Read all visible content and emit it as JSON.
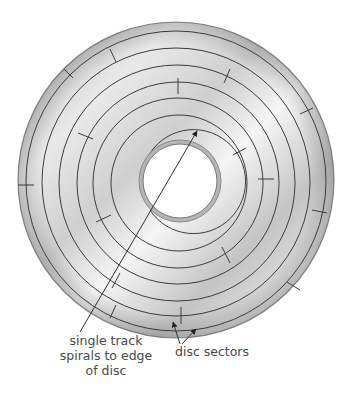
{
  "figure": {
    "colors": {
      "disc_light": "#f2f2f2",
      "disc_mid": "#c8c8c8",
      "disc_dark": "#9a9a9a",
      "track_line": "#3c3c3c",
      "label_text": "#4a4a4a"
    }
  },
  "labels": {
    "track": {
      "line1": "single track",
      "line2": "spirals to edge",
      "line3": "of disc"
    },
    "sectors": {
      "text": "disc sectors"
    }
  },
  "disc": {
    "center": [
      176,
      180
    ],
    "outer_radius": 158,
    "hole_radius": 38,
    "track_radii": [
      150,
      134,
      118,
      101,
      85,
      68,
      52
    ],
    "sector_count_visible": 20
  }
}
